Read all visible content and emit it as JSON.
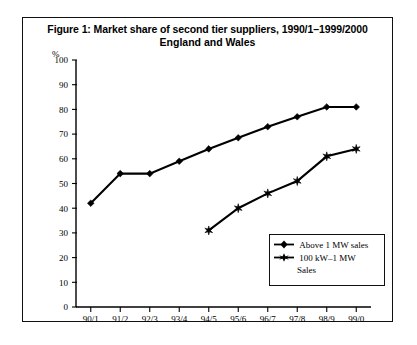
{
  "figure": {
    "title_line_1": "Figure 1: Market share of second tier suppliers, 1990/1–1999/2000",
    "title_line_2": "England and Wales",
    "y_axis_unit": "%"
  },
  "legend": {
    "entries": [
      {
        "label": "Above 1 MW sales",
        "marker": "diamond-marker",
        "color": "#000000"
      },
      {
        "label": "100 kW–1 MW",
        "label_wrap": "Sales",
        "marker": "star-marker",
        "color": "#000000"
      }
    ]
  },
  "chart_data": {
    "type": "line",
    "title": "Figure 1: Market share of second tier suppliers, 1990/1–1999/2000 England and Wales",
    "xlabel": "",
    "ylabel": "%",
    "ylim": [
      0,
      100
    ],
    "yticks": [
      0,
      10,
      20,
      30,
      40,
      50,
      60,
      70,
      80,
      90,
      100
    ],
    "ytick_labels": [
      "0",
      "10",
      "20",
      "30",
      "40",
      "50",
      "60",
      "70",
      "80",
      "90",
      "100"
    ],
    "categories": [
      "90/1",
      "91/2",
      "92/3",
      "93/4",
      "94/5",
      "95/6",
      "96/7",
      "97/8",
      "98/9",
      "99/0"
    ],
    "grid": false,
    "legend_position": "inside-bottom-right",
    "series": [
      {
        "name": "Above 1 MW sales",
        "marker": "diamond-marker",
        "color": "#000000",
        "values": [
          42,
          54,
          54,
          59,
          64,
          68.5,
          73,
          77,
          81,
          81
        ]
      },
      {
        "name": "100 kW–1 MW Sales",
        "marker": "star-marker",
        "color": "#000000",
        "values": [
          null,
          null,
          null,
          null,
          31,
          40,
          46,
          51,
          61,
          64
        ]
      }
    ]
  }
}
